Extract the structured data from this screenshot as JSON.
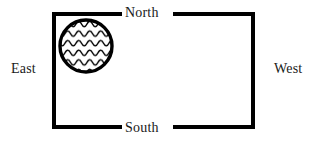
{
  "diagram": {
    "background_color": "#ffffff",
    "line_color": "#000000",
    "text_color": "#1a1a1a",
    "labels": {
      "north": "North",
      "south": "South",
      "east": "East",
      "west": "West"
    },
    "box": {
      "name": "direction-rectangle",
      "x": 52,
      "y": 12,
      "width": 203,
      "height": 117,
      "stroke_width": 4
    },
    "circle": {
      "name": "hatched-circle",
      "fill_pattern": "wavy-lines",
      "center_x": 86,
      "center_y": 46,
      "radius": 27,
      "stroke_width": 3
    }
  }
}
